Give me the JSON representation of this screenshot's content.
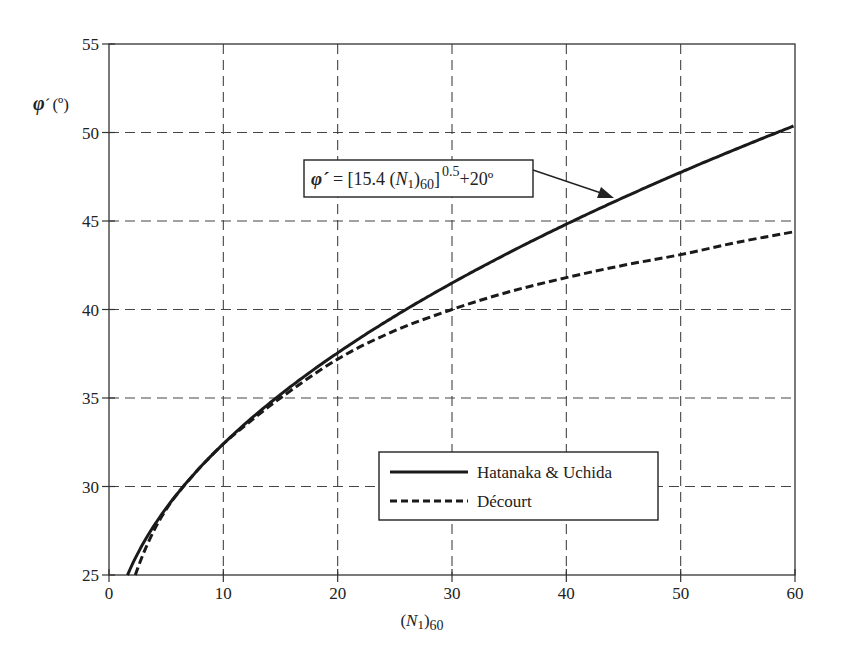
{
  "chart_data": {
    "type": "line",
    "title": "",
    "xlabel": "(N1)60",
    "ylabel": "φ´(º)",
    "xlim": [
      0,
      60
    ],
    "ylim": [
      25,
      55
    ],
    "x_ticks": [
      0,
      10,
      20,
      30,
      40,
      50,
      60
    ],
    "y_ticks": [
      25,
      30,
      35,
      40,
      45,
      50,
      55
    ],
    "grid": true,
    "grid_style": "dashed",
    "legend_position": "lower right (inside)",
    "annotation": {
      "text": "φ´ = [15.4 (N1)60]^0.5 +20º",
      "points_to_series": "Hatanaka & Uchida",
      "arrow_target_x": 44
    },
    "series": [
      {
        "name": "Hatanaka & Uchida",
        "style": "solid",
        "formula": "phi = sqrt(15.4 * N) + 20",
        "x": [
          1.62,
          2,
          3,
          4,
          5,
          6,
          8,
          10,
          12,
          15,
          20,
          25,
          30,
          35,
          40,
          45,
          50,
          55,
          60
        ],
        "values": [
          25.0,
          25.55,
          26.8,
          27.85,
          28.77,
          29.61,
          31.1,
          32.41,
          33.59,
          35.2,
          37.55,
          39.62,
          41.49,
          43.22,
          44.82,
          46.32,
          47.75,
          49.1,
          50.4
        ]
      },
      {
        "name": "Décourt",
        "style": "dashed",
        "x": [
          2.3,
          3,
          4,
          5,
          6,
          8,
          10,
          12,
          15,
          20,
          25,
          30,
          35,
          40,
          45,
          50,
          55,
          60
        ],
        "values": [
          25.0,
          26.2,
          27.6,
          28.7,
          29.6,
          31.1,
          32.4,
          33.5,
          35.0,
          37.2,
          38.8,
          40.0,
          41.0,
          41.8,
          42.5,
          43.1,
          43.8,
          44.4
        ]
      }
    ]
  },
  "axis": {
    "y_label_main": "φ",
    "y_label_prime": "´",
    "y_label_unit": "(º)",
    "x_label_open": "(",
    "x_label_var": "N",
    "x_label_sub1": "1",
    "x_label_close": ")",
    "x_label_sub60": "60"
  },
  "annotation": {
    "phi": "φ´",
    "eq": " = [15.4 (",
    "var": "N",
    "sub1": "1",
    "close": ")",
    "sub60": "60",
    "bracket": "]",
    "exp": "0.5",
    "tail": "+20º"
  },
  "legend": {
    "items": [
      {
        "label": "Hatanaka & Uchida",
        "style": "solid"
      },
      {
        "label": "Décourt",
        "style": "dashed"
      }
    ]
  },
  "colors": {
    "line": "#1a1a1a",
    "grid": "#444444",
    "frame": "#333333"
  }
}
